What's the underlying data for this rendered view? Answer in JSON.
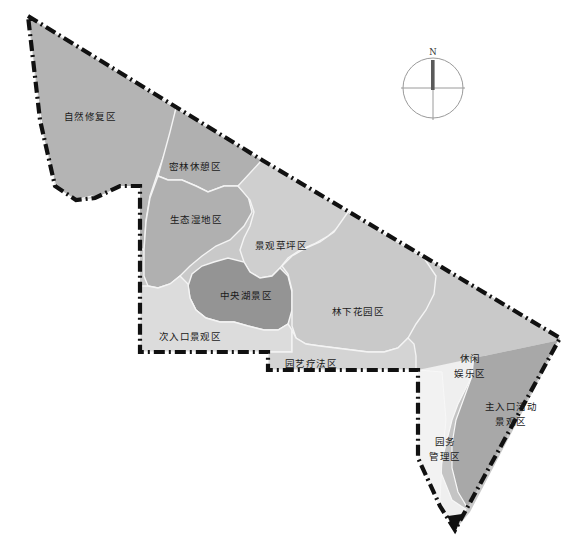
{
  "map": {
    "title": "公园功能分区图",
    "background_color": "#ffffff",
    "boundary": {
      "name": "site-boundary",
      "style": "dash-dot",
      "color": "#111111",
      "width": 4
    },
    "internal_border_color": "#f2f2f2",
    "colors": {
      "tone_dark": "#8e8e8e",
      "tone_mid_dark": "#a3a3a3",
      "tone_mid": "#b4b4b4",
      "tone_light_mid": "#c6c6c6",
      "tone_light": "#d6d6d6",
      "tone_lighter": "#e2e2e2",
      "tone_pale": "#eeeeee",
      "tone_near_white": "#f5f5f5"
    },
    "zones": [
      {
        "id": "natural-restoration",
        "label": "自然修复区",
        "label_lines": [
          "自然修复区"
        ],
        "fill": "#b4b4b4",
        "label_x": 90,
        "label_y": 115
      },
      {
        "id": "dense-forest-rest",
        "label": "密林休憩区",
        "label_lines": [
          "密林休憩区"
        ],
        "fill": "#b0b0b0",
        "label_x": 195,
        "label_y": 167
      },
      {
        "id": "ecological-wetland",
        "label": "生态湿地区",
        "label_lines": [
          "生态湿地区"
        ],
        "fill": "#b0b0b0",
        "label_x": 196,
        "label_y": 220
      },
      {
        "id": "landscape-lawn",
        "label": "景观草坪区",
        "label_lines": [
          "景观草坪区"
        ],
        "fill": "#cfcfcf",
        "label_x": 281,
        "label_y": 246
      },
      {
        "id": "central-lake",
        "label": "中央湖景区",
        "label_lines": [
          "中央湖景区"
        ],
        "fill": "#949494",
        "label_x": 246,
        "label_y": 296
      },
      {
        "id": "secondary-entrance",
        "label": "次入口景观区",
        "label_lines": [
          "次入口景观区"
        ],
        "fill": "#dcdcdc",
        "label_x": 189,
        "label_y": 336
      },
      {
        "id": "understory-garden",
        "label": "林下花园区",
        "label_lines": [
          "林下花园区"
        ],
        "fill": "#c9c9c9",
        "label_x": 358,
        "label_y": 311
      },
      {
        "id": "horticultural-therapy",
        "label": "园艺疗法区",
        "label_lines": [
          "园艺疗法区"
        ],
        "fill": "#d4d4d4",
        "label_x": 311,
        "label_y": 364
      },
      {
        "id": "leisure-recreation",
        "label": "休闲娱乐区",
        "label_lines": [
          "休闲",
          "娱乐区"
        ],
        "fill": "#c4c4c4",
        "label_x": 470,
        "label_y": 364
      },
      {
        "id": "main-entrance-activity",
        "label": "主入口活动景观区",
        "label_lines": [
          "主入口活动",
          "景观区"
        ],
        "fill": "#a8a8a8",
        "label_x": 511,
        "label_y": 412
      },
      {
        "id": "park-management",
        "label": "园务管理区",
        "label_lines": [
          "园务",
          "管理区"
        ],
        "fill": "#efefef",
        "label_x": 444,
        "label_y": 447
      }
    ],
    "compass": {
      "name": "compass-rose",
      "north_label": "N",
      "center_x": 433,
      "center_y": 88,
      "radius": 30,
      "ring_color": "#9a9a9a",
      "needle_color": "#555555"
    }
  }
}
